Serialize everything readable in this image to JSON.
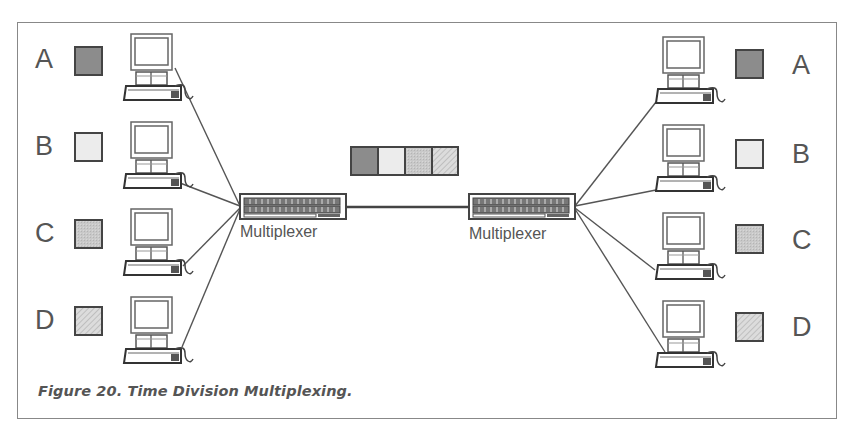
{
  "figure": {
    "caption": "Figure 20.  Time Division Multiplexing."
  },
  "multiplexers": {
    "left": {
      "label": "Multiplexer"
    },
    "right": {
      "label": "Multiplexer"
    }
  },
  "channels": [
    {
      "id": "A",
      "label": "A",
      "color": "#8c8c8c",
      "pattern": "solid"
    },
    {
      "id": "B",
      "label": "B",
      "color": "#ececec",
      "pattern": "solid"
    },
    {
      "id": "C",
      "label": "C",
      "color": "#c6c6c6",
      "pattern": "stipple"
    },
    {
      "id": "D",
      "label": "D",
      "color": "#d8d8d8",
      "pattern": "hatched"
    }
  ],
  "left_nodes": {
    "A": {
      "label": "A"
    },
    "B": {
      "label": "B"
    },
    "C": {
      "label": "C"
    },
    "D": {
      "label": "D"
    }
  },
  "right_nodes": {
    "A": {
      "label": "A"
    },
    "B": {
      "label": "B"
    },
    "C": {
      "label": "C"
    },
    "D": {
      "label": "D"
    }
  },
  "frame_slots": [
    "A",
    "B",
    "C",
    "D"
  ],
  "colors": {
    "line": "#555555",
    "border": "#444444",
    "text": "#555555"
  }
}
